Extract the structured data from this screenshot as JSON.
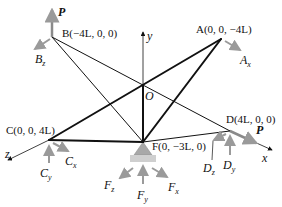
{
  "diagram": {
    "type": "3D truss with support reactions",
    "colors": {
      "member": "#111111",
      "reaction_arrow": "#9a9a9a",
      "load_arrow": "#8a8a8a",
      "support": "#a8a8a8",
      "support_base": "#cfcfcf"
    },
    "nodes": {
      "A": {
        "label": "A(0, 0, −4L)",
        "px": [
          221,
          39
        ]
      },
      "B": {
        "label": "B(−4L, 0, 0)",
        "px": [
          52,
          37
        ]
      },
      "C": {
        "label": "C(0, 0, 4L)",
        "px": [
          49,
          140
        ]
      },
      "D": {
        "label": "D(4L, 0, 0)",
        "px": [
          230,
          131
        ]
      },
      "F": {
        "label": "F(0, −3L, 0)",
        "px": [
          143,
          142
        ]
      },
      "O": {
        "label": "O",
        "px": [
          143,
          85
        ]
      }
    },
    "members": [
      {
        "from": "B",
        "to": "D",
        "weight": "thin"
      },
      {
        "from": "B",
        "to": "F",
        "weight": "thin"
      },
      {
        "from": "C",
        "to": "A",
        "weight": "thick"
      },
      {
        "from": "C",
        "to": "F",
        "weight": "thick"
      },
      {
        "from": "A",
        "to": "F",
        "weight": "thick"
      },
      {
        "from": "O",
        "to": "F",
        "weight": "thick"
      },
      {
        "from": "F",
        "to": "D",
        "weight": "thin"
      }
    ],
    "axes": {
      "x": "x",
      "y": "y",
      "z": "z"
    },
    "loads": {
      "P_B": "P",
      "P_D": "P"
    },
    "reactions": {
      "Ax": {
        "main": "A",
        "sub": "x"
      },
      "Bz": {
        "main": "B",
        "sub": "z"
      },
      "Cx": {
        "main": "C",
        "sub": "x"
      },
      "Cy": {
        "main": "C",
        "sub": "y"
      },
      "Dz": {
        "main": "D",
        "sub": "z"
      },
      "Dy": {
        "main": "D",
        "sub": "y"
      },
      "Fz": {
        "main": "F",
        "sub": "z"
      },
      "Fy": {
        "main": "F",
        "sub": "y"
      },
      "Fx": {
        "main": "F",
        "sub": "x"
      }
    }
  }
}
